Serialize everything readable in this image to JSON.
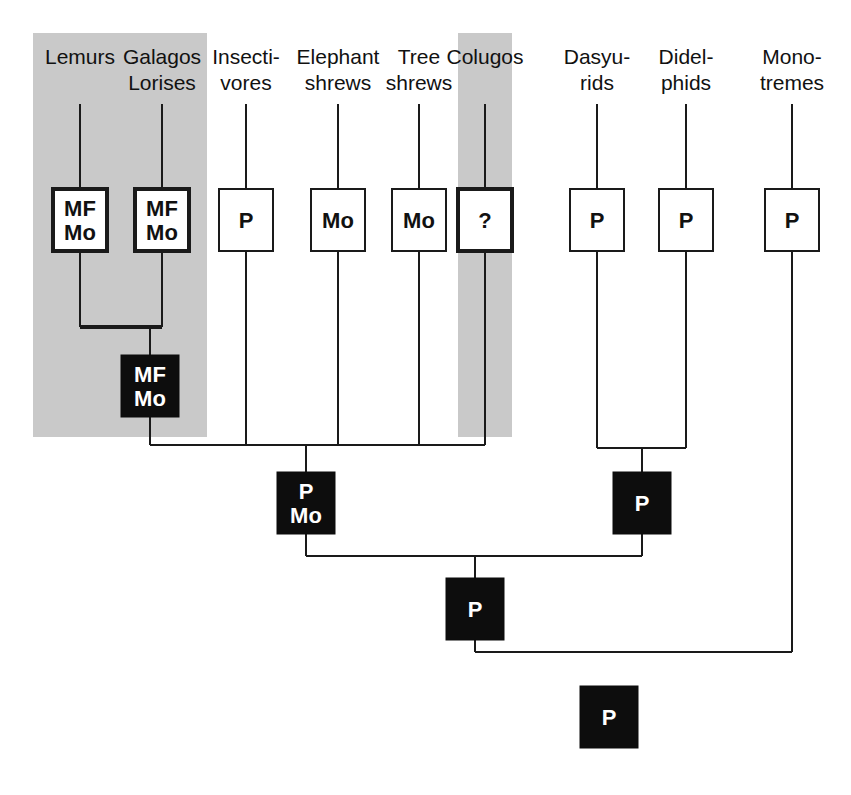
{
  "figure": {
    "kind": "cladogram",
    "background_color": "#ffffff",
    "line_color": "#1a1a1a",
    "highlight_panel_color": "#c9c9c9",
    "filled_node_color": "#0d0d0d",
    "filled_node_text_color": "#ffffff",
    "open_node_fill": "#ffffff",
    "open_node_text_color": "#111111"
  },
  "highlight_panels": [
    {
      "name": "primates-panel",
      "x": 33,
      "y": 33,
      "width": 174,
      "height": 404
    },
    {
      "name": "colugos-panel",
      "x": 458,
      "y": 33,
      "width": 54,
      "height": 404
    }
  ],
  "taxa": [
    {
      "id": "lemurs",
      "label_lines": [
        "Lemurs"
      ],
      "x": 80,
      "highlighted": true,
      "state": {
        "text_lines": [
          "MF",
          "Mo"
        ],
        "style": "open",
        "thick": true
      }
    },
    {
      "id": "galagos-lorises",
      "label_lines": [
        "Galagos",
        "Lorises"
      ],
      "x": 162,
      "highlighted": true,
      "state": {
        "text_lines": [
          "MF",
          "Mo"
        ],
        "style": "open",
        "thick": true
      }
    },
    {
      "id": "insectivores",
      "label_lines": [
        "Insecti-",
        "vores"
      ],
      "x": 246,
      "highlighted": false,
      "state": {
        "text_lines": [
          "P"
        ],
        "style": "open",
        "thick": false
      }
    },
    {
      "id": "elephant-shrews",
      "label_lines": [
        "Elephant",
        "shrews"
      ],
      "x": 338,
      "highlighted": false,
      "state": {
        "text_lines": [
          "Mo"
        ],
        "style": "open",
        "thick": false
      }
    },
    {
      "id": "tree-shrews",
      "label_lines": [
        "Tree",
        "shrews"
      ],
      "x": 419,
      "highlighted": false,
      "state": {
        "text_lines": [
          "Mo"
        ],
        "style": "open",
        "thick": false
      }
    },
    {
      "id": "colugos",
      "label_lines": [
        "Colugos"
      ],
      "x": 485,
      "highlighted": true,
      "state": {
        "text_lines": [
          "?"
        ],
        "style": "open",
        "thick": true
      }
    },
    {
      "id": "dasyurids",
      "label_lines": [
        "Dasyu-",
        "rids"
      ],
      "x": 597,
      "highlighted": false,
      "state": {
        "text_lines": [
          "P"
        ],
        "style": "open",
        "thick": false
      }
    },
    {
      "id": "didelphids",
      "label_lines": [
        "Didel-",
        "phids"
      ],
      "x": 686,
      "highlighted": false,
      "state": {
        "text_lines": [
          "P"
        ],
        "style": "open",
        "thick": false
      }
    },
    {
      "id": "monotremes",
      "label_lines": [
        "Mono-",
        "tremes"
      ],
      "x": 792,
      "highlighted": false,
      "state": {
        "text_lines": [
          "P"
        ],
        "style": "open",
        "thick": false
      }
    }
  ],
  "internal_nodes": [
    {
      "id": "node-primates",
      "text_lines": [
        "MF",
        "Mo"
      ],
      "x": 121,
      "y": 355,
      "width": 58,
      "height": 62,
      "style": "filled"
    },
    {
      "id": "node-archonta-insectivora",
      "text_lines": [
        "P",
        "Mo"
      ],
      "x": 277,
      "y": 472,
      "width": 58,
      "height": 62,
      "style": "filled"
    },
    {
      "id": "node-marsupials",
      "text_lines": [
        "P"
      ],
      "x": 613,
      "y": 472,
      "width": 58,
      "height": 62,
      "style": "filled"
    },
    {
      "id": "node-therians",
      "text_lines": [
        "P"
      ],
      "x": 446,
      "y": 578,
      "width": 58,
      "height": 62,
      "style": "filled"
    },
    {
      "id": "node-mammals-root",
      "text_lines": [
        "P"
      ],
      "x": 580,
      "y": 686,
      "width": 58,
      "height": 62,
      "style": "filled"
    }
  ],
  "terminal_box": {
    "width": 54,
    "height": 62,
    "top_y": 189
  },
  "geometry": {
    "label_baseline_first": 64,
    "label_line_height": 26,
    "stem_top_y": 104,
    "primate_junction_y": 327,
    "eutherian_junction_y": 445,
    "marsupial_junction_y": 448,
    "therian_junction_y": 556,
    "root_junction_y": 652,
    "thin_stroke": 2,
    "thick_stroke": 4
  }
}
